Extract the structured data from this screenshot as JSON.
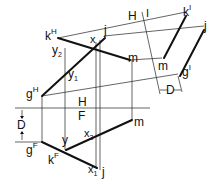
{
  "diagram": {
    "type": "descriptive-geometry-auxiliary-view",
    "fold_lines": [
      {
        "id": "H-F",
        "upper": "H",
        "lower": "F"
      },
      {
        "id": "H-1",
        "left": "H",
        "right": "1"
      }
    ],
    "labels": {
      "kH": {
        "base": "k",
        "sup": "H"
      },
      "jH": {
        "base": "j",
        "sup": ""
      },
      "xH": {
        "base": "x",
        "sup": ""
      },
      "y2": {
        "base": "y",
        "sub": "2"
      },
      "y1": {
        "base": "y",
        "sub": "1"
      },
      "mH": {
        "base": "m",
        "sup": ""
      },
      "gH": {
        "base": "g",
        "sup": "H"
      },
      "H_top": "H",
      "one": "I",
      "k1": {
        "base": "k",
        "sup": "I"
      },
      "j1": {
        "base": "j",
        "sup": ""
      },
      "m1": {
        "base": "m",
        "sup": ""
      },
      "g1": {
        "base": "g",
        "sup": "I"
      },
      "D_right": "D",
      "H_fold": "H",
      "F_fold": "F",
      "D_left": "D",
      "gF": {
        "base": "g",
        "sup": "F"
      },
      "kF": {
        "base": "k",
        "sup": "F"
      },
      "yF": {
        "base": "y",
        "sup": ""
      },
      "x2": {
        "base": "x",
        "sub": "2"
      },
      "x1": {
        "base": "x",
        "sub": "1"
      },
      "mF": {
        "base": "m",
        "sup": ""
      },
      "jF": {
        "base": "j",
        "sup": ""
      }
    }
  }
}
